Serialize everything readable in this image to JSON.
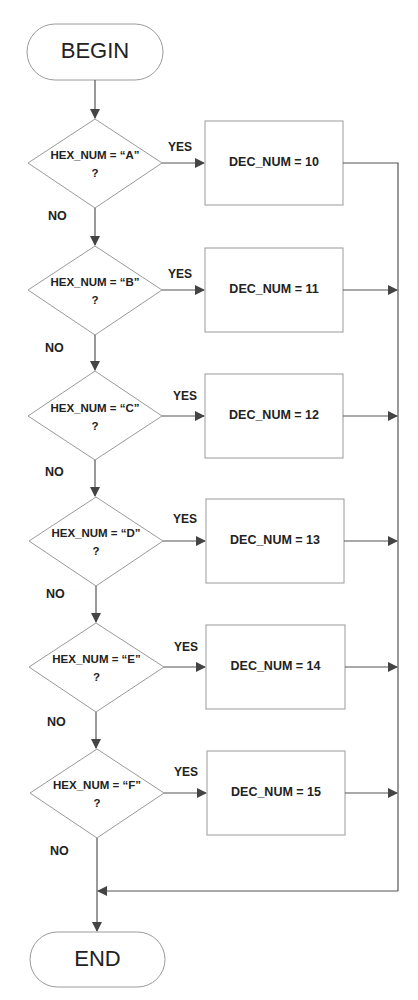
{
  "diagram": {
    "type": "flowchart",
    "start": {
      "label": "BEGIN"
    },
    "end": {
      "label": "END"
    },
    "yes_label": "YES",
    "no_label": "NO",
    "decisions": [
      {
        "line1": "HEX_NUM = “A”",
        "line2": "?",
        "action": "DEC_NUM = 10"
      },
      {
        "line1": "HEX_NUM = “B”",
        "line2": "?",
        "action": "DEC_NUM = 11"
      },
      {
        "line1": "HEX_NUM = “C”",
        "line2": "?",
        "action": "DEC_NUM = 12"
      },
      {
        "line1": "HEX_NUM = “D”",
        "line2": "?",
        "action": "DEC_NUM = 13"
      },
      {
        "line1": "HEX_NUM = “E”",
        "line2": "?",
        "action": "DEC_NUM = 14"
      },
      {
        "line1": "HEX_NUM = “F”",
        "line2": "?",
        "action": "DEC_NUM = 15"
      }
    ],
    "colors": {
      "shape_stroke": "#9a9a9a",
      "connector": "#555555",
      "arrowhead": "#444444",
      "text": "#222222",
      "background": "#ffffff"
    }
  }
}
